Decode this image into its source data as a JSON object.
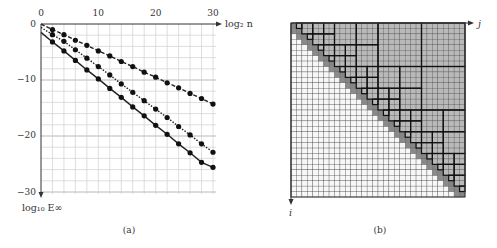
{
  "panel_a": {
    "caption": "(a)",
    "xlabel": "log₂ n",
    "ylabel": "log₁₀ E∞",
    "xticks": [
      "0",
      "10",
      "20",
      "30"
    ],
    "yticks": [
      "0",
      "−10",
      "−20",
      "−30"
    ]
  },
  "panel_b": {
    "caption": "(b)",
    "xlabel": "j",
    "ylabel": "i",
    "grid_size": 32,
    "block_boundaries": [
      0,
      1,
      2,
      3,
      4,
      6,
      8,
      12,
      16,
      24,
      32
    ]
  },
  "chart_data": {
    "type": "line",
    "title": "",
    "xlabel": "log2 n",
    "ylabel": "log10 E_inf",
    "xlim": [
      0,
      30
    ],
    "ylim": [
      -30,
      0
    ],
    "grid": true,
    "x": [
      0,
      2,
      4,
      6,
      8,
      10,
      12,
      14,
      16,
      18,
      20,
      22,
      24,
      26,
      28,
      30
    ],
    "series": [
      {
        "name": "dashed",
        "style": "dashed",
        "values": [
          0,
          -1.0,
          -1.9,
          -2.9,
          -3.8,
          -4.8,
          -5.7,
          -6.7,
          -7.6,
          -8.6,
          -9.5,
          -10.5,
          -11.4,
          -12.4,
          -13.3,
          -14.3
        ]
      },
      {
        "name": "dotted",
        "style": "dotted",
        "values": [
          -0.6,
          -1.9,
          -3.1,
          -4.6,
          -6.1,
          -7.6,
          -9.1,
          -10.7,
          -12.2,
          -13.7,
          -15.2,
          -16.7,
          -18.3,
          -19.8,
          -21.4,
          -22.9
        ]
      },
      {
        "name": "solid",
        "style": "solid",
        "values": [
          -1.5,
          -3.2,
          -4.8,
          -6.5,
          -8.2,
          -9.8,
          -11.5,
          -13.1,
          -14.8,
          -16.4,
          -18.1,
          -19.7,
          -21.4,
          -23.0,
          -24.7,
          -25.6
        ]
      }
    ]
  }
}
